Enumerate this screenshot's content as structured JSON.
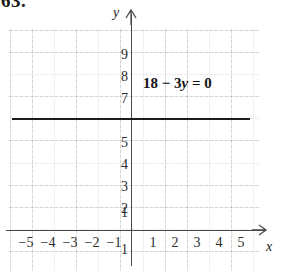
{
  "problem": {
    "number": "63."
  },
  "figure": {
    "equation_label": {
      "lhs_a": "18",
      "minus": "−",
      "coef": "3",
      "variable": "y",
      "equals": "=",
      "rhs": "0",
      "full": "18 − 3y = 0"
    },
    "axis_labels": {
      "x": "x",
      "y": "y"
    }
  },
  "chart_data": {
    "type": "line",
    "title": "",
    "subtitle": "",
    "xlabel": "x",
    "ylabel": "y",
    "grid": true,
    "legend": false,
    "annotations": [
      "18 − 3y = 0"
    ],
    "equation": "18 - 3y = 0",
    "solved_form": "y = 6",
    "series": [
      {
        "name": "18 - 3y = 0",
        "type": "horizontal-line",
        "y_value": 6,
        "x_from": -5.5,
        "x_to": 5.4,
        "color": "#1c1c1c"
      }
    ],
    "xlim": [
      -5.8,
      6.0
    ],
    "ylim": [
      -1.6,
      10.0
    ],
    "x_ticks": [
      -5,
      -4,
      -3,
      -2,
      -1,
      1,
      2,
      3,
      4,
      5
    ],
    "x_tick_labels": [
      "−5",
      "−4",
      "−3",
      "−2",
      "−1",
      "1",
      "2",
      "3",
      "4",
      "5"
    ],
    "y_ticks": [
      -1,
      1,
      2,
      3,
      4,
      5,
      7,
      8,
      9
    ],
    "y_tick_labels": [
      "1",
      "1",
      "2",
      "3",
      "4",
      "5",
      "7",
      "8",
      "9"
    ]
  },
  "ticks": {
    "y_upper": [
      {
        "label": "9",
        "top": 48
      },
      {
        "label": "8",
        "top": 70
      },
      {
        "label": "7",
        "top": 92
      }
    ],
    "y_lower": [
      {
        "label": "5",
        "top": 136
      },
      {
        "label": "4",
        "top": 158
      },
      {
        "label": "3",
        "top": 180
      },
      {
        "label": "2",
        "top": 202
      },
      {
        "label": "1",
        "top": 207
      }
    ],
    "y_negative": {
      "label": "1"
    },
    "x_negative": [
      {
        "label": "−5",
        "left": 18
      },
      {
        "label": "−4",
        "left": 40
      },
      {
        "label": "−3",
        "left": 62
      },
      {
        "label": "−2",
        "left": 84
      },
      {
        "label": "−1",
        "left": 106
      }
    ],
    "x_positive": [
      {
        "label": "1",
        "left": 145
      },
      {
        "label": "2",
        "left": 167
      },
      {
        "label": "3",
        "left": 189
      },
      {
        "label": "4",
        "left": 211
      },
      {
        "label": "5",
        "left": 233
      }
    ]
  }
}
